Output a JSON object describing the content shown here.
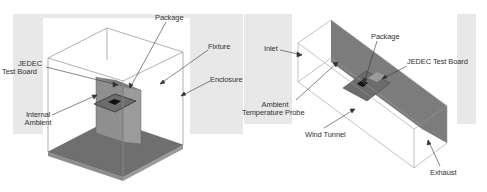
{
  "left_diagram": {
    "title": "Natural convection enclosure (JEDEC still-air)",
    "labels": {
      "package": "Package",
      "jedec_board_line1": "JEDEC",
      "jedec_board_line2": "Test Board",
      "fixture": "Fixture",
      "enclosure": "Enclosure",
      "internal_ambient_line1": "Internal",
      "internal_ambient_line2": "Ambient"
    }
  },
  "right_diagram": {
    "title": "Forced convection wind tunnel",
    "labels": {
      "inlet": "Inlet",
      "package": "Package",
      "jedec_board": "JEDEC Test Board",
      "probe_line1": "Ambient",
      "probe_line2": "Temperature  Probe",
      "wind_tunnel": "Wind Tunnel",
      "exhaust": "Exhaust"
    }
  },
  "colors": {
    "background_band": "#e6e6e6",
    "panel_bg": "#ffffff",
    "edge": "#8a8a8a",
    "board": "#8c8c8c",
    "floor": "#6e6e6e",
    "wall": "#7d7d7d",
    "package": "#1a1a1a",
    "text": "#333333"
  }
}
